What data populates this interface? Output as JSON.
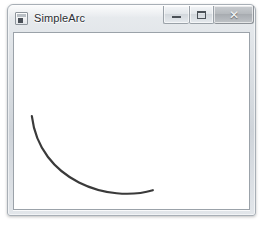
{
  "window": {
    "title": "SimpleArc",
    "icon": "form-window-icon",
    "controls": {
      "minimize_label": "–",
      "maximize_label": "□",
      "close_label": "✕",
      "minimize_name": "minimize-button",
      "maximize_name": "maximize-button",
      "close_name": "close-button"
    },
    "colors": {
      "frame_light": "#e9ecef",
      "frame_dark": "#cfd4da",
      "frame_border": "#a8afb6",
      "client_background": "#ffffff",
      "client_border": "#9ba2a9",
      "title_text": "#2b2f34",
      "close_button": "#b6babe"
    }
  },
  "drawing": {
    "name": "simple-arc",
    "description": "Downward open arc (lower half of an ellipse)",
    "stroke_color": "#3a3a3a",
    "stroke_width": 2.2,
    "fill": "none",
    "path": "M 18 84 C 26 150, 96 172, 140 159",
    "geometry": {
      "start_point": [
        18,
        84
      ],
      "end_point": [
        140,
        159
      ],
      "control_points": [
        [
          26,
          150
        ],
        [
          96,
          172
        ]
      ],
      "lowest_point_approx": [
        100,
        167
      ],
      "viewbox": [
        0,
        0,
        237,
        178
      ]
    }
  }
}
